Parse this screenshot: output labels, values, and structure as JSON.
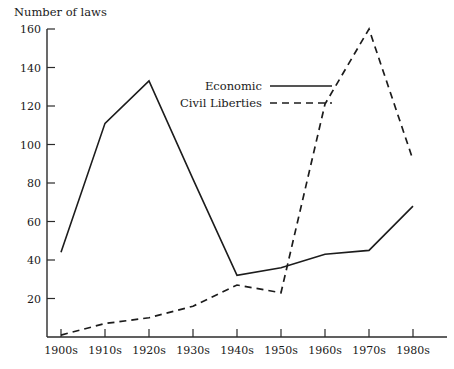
{
  "chart_data": {
    "type": "line",
    "title": "",
    "ylabel": "Number of laws",
    "xlabel": "",
    "categories": [
      "1900s",
      "1910s",
      "1920s",
      "1930s",
      "1940s",
      "1950s",
      "1960s",
      "1970s",
      "1980s"
    ],
    "series": [
      {
        "name": "Economic",
        "style": "solid",
        "values": [
          44,
          111,
          133,
          82,
          32,
          36,
          43,
          45,
          68
        ]
      },
      {
        "name": "Civil Liberties",
        "style": "dashed",
        "values": [
          1,
          7,
          10,
          16,
          27,
          23,
          121,
          160,
          92
        ]
      }
    ],
    "ylim": [
      0,
      160
    ],
    "yticks": [
      20,
      40,
      60,
      80,
      100,
      120,
      140,
      160
    ],
    "ytick_labels": [
      "20",
      "40",
      "60",
      "80",
      "100",
      "120",
      "140",
      "160"
    ],
    "grid": false,
    "legend_position": "top-center-right"
  },
  "legend": {
    "entries": [
      {
        "label": "Economic",
        "style": "solid"
      },
      {
        "label": "Civil Liberties",
        "style": "dashed"
      }
    ]
  }
}
